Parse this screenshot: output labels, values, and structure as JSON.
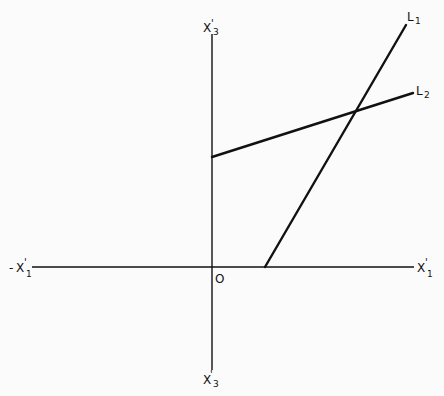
{
  "figure": {
    "type": "diagram",
    "colors": {
      "background": "#fbfbfb",
      "ink": "#111111"
    },
    "axes": {
      "horizontal": {
        "negative_label": {
          "sign": "-",
          "base": "X",
          "prime": "'",
          "subscript": "1"
        },
        "positive_label": {
          "base": "X",
          "prime": "'",
          "subscript": "1"
        },
        "x1": 32,
        "x2": 414,
        "y": 267
      },
      "vertical": {
        "top_label": {
          "base": "X",
          "prime": "'",
          "subscript": "3"
        },
        "bottom_label": {
          "base": "X",
          "prime": "'",
          "subscript": "3"
        },
        "x": 212,
        "y1": 34,
        "y2": 370
      },
      "origin_label": "O"
    },
    "lines": [
      {
        "name": "L1",
        "label": {
          "base": "L",
          "subscript": "1"
        },
        "x1": 265,
        "y1": 267,
        "x2": 406,
        "y2": 25
      },
      {
        "name": "L2",
        "label": {
          "base": "L",
          "subscript": "2"
        },
        "x1": 212,
        "y1": 157,
        "x2": 413,
        "y2": 93
      }
    ],
    "intersection": {
      "x": 354,
      "y": 113
    }
  }
}
